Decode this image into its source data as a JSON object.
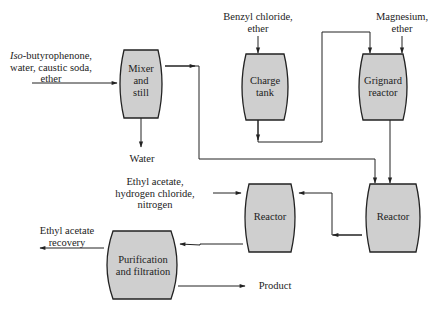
{
  "diagram": {
    "type": "process-flow",
    "units": [
      {
        "id": "mixer",
        "label": "Mixer and still",
        "lines": [
          "Mixer",
          "and",
          "still"
        ]
      },
      {
        "id": "charge_tank",
        "label": "Charge tank",
        "lines": [
          "Charge",
          "tank"
        ]
      },
      {
        "id": "grignard",
        "label": "Grignard reactor",
        "lines": [
          "Grignard",
          "reactor"
        ]
      },
      {
        "id": "reactor_right",
        "label": "Reactor",
        "lines": [
          "Reactor"
        ]
      },
      {
        "id": "reactor_mid",
        "label": "Reactor",
        "lines": [
          "Reactor"
        ]
      },
      {
        "id": "purification",
        "label": "Purification and filtration",
        "lines": [
          "Purification",
          "and filtration"
        ]
      }
    ],
    "streams": {
      "feed_mixer": {
        "italic": "Iso",
        "line1_rest": "-butyrophenone,",
        "line2": "water, caustic soda,",
        "line3": "ether"
      },
      "water_out": "Water",
      "feed_charge": {
        "line1": "Benzyl chloride,",
        "line2": "ether"
      },
      "feed_grignard": {
        "line1": "Magnesium,",
        "line2": "ether"
      },
      "feed_reactor_mid": {
        "line1": "Ethyl acetate,",
        "line2": "hydrogen chloride,",
        "line3": "nitrogen"
      },
      "ethyl_recovery": {
        "line1": "Ethyl acetate",
        "line2": "recovery"
      },
      "product": "Product"
    },
    "edges": [
      {
        "from": "feed_mixer",
        "to": "mixer"
      },
      {
        "from": "mixer",
        "to": "water_out"
      },
      {
        "from": "mixer",
        "to": "reactor_right"
      },
      {
        "from": "feed_charge",
        "to": "charge_tank"
      },
      {
        "from": "charge_tank",
        "to": "grignard"
      },
      {
        "from": "feed_grignard",
        "to": "grignard"
      },
      {
        "from": "grignard",
        "to": "reactor_right"
      },
      {
        "from": "reactor_right",
        "to": "reactor_mid"
      },
      {
        "from": "feed_reactor_mid",
        "to": "reactor_mid"
      },
      {
        "from": "reactor_mid",
        "to": "purification"
      },
      {
        "from": "purification",
        "to": "ethyl_recovery"
      },
      {
        "from": "purification",
        "to": "product"
      }
    ],
    "colors": {
      "vessel_fill": "#cfcfcf",
      "stroke": "#222222",
      "background": "#ffffff"
    }
  }
}
